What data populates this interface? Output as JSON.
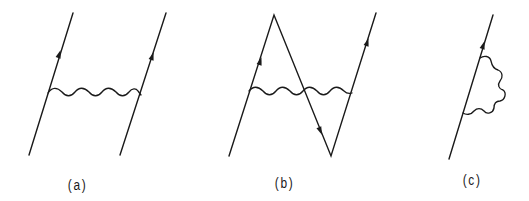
{
  "figure": {
    "panels": [
      {
        "id": "a",
        "label": "(a)",
        "description": "Two parallel fermion lines with upward arrows connected by a wavy photon line (exchange diagram)",
        "fermion_lines": [
          {
            "from": [
              29,
              155
            ],
            "to": [
              73,
              13
            ],
            "arrow_at": [
              59,
              55
            ],
            "direction": "up"
          },
          {
            "from": [
              120,
              155
            ],
            "to": [
              166,
              13
            ],
            "arrow_at": [
              152,
              57
            ],
            "direction": "up"
          }
        ],
        "photon": {
          "from": [
            48,
            93
          ],
          "to": [
            142,
            93
          ],
          "type": "wavy"
        }
      },
      {
        "id": "b",
        "label": "(b)",
        "description": "Zig-zag fermion line (up, down, up) with a wavy photon line crossing horizontally (Z-graph)",
        "fermion_lines": [
          {
            "from": [
              229,
              156
            ],
            "to": [
              274,
              15
            ],
            "arrow_at": [
              260,
              62
            ],
            "direction": "up"
          },
          {
            "from": [
              274,
              15
            ],
            "to": [
              331,
              156
            ],
            "arrow_at": [
              320,
              131
            ],
            "direction": "down"
          },
          {
            "from": [
              331,
              156
            ],
            "to": [
              376,
              13
            ],
            "arrow_at": [
              367,
              43
            ],
            "direction": "up"
          }
        ],
        "photon": {
          "from": [
            249,
            92
          ],
          "to": [
            352,
            92
          ],
          "type": "wavy"
        }
      },
      {
        "id": "c",
        "label": "(c)",
        "description": "Single fermion line with upward arrow and a wavy photon loop attached (self-energy diagram)",
        "fermion_lines": [
          {
            "from": [
              449,
              159
            ],
            "to": [
              493,
              15
            ],
            "arrow_at": [
              483,
              45
            ],
            "direction": "up"
          }
        ],
        "photon": {
          "from": [
            480,
            58
          ],
          "to": [
            463,
            114
          ],
          "type": "wavy-loop"
        }
      }
    ],
    "colors": {
      "ink": "#1a1a1a",
      "background": "#ffffff"
    }
  }
}
